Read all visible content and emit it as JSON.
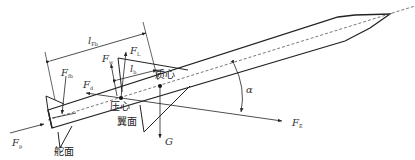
{
  "diagram": {
    "type": "rocket force diagram",
    "labels": {
      "l_fb": {
        "main": "l",
        "sub": "Fb"
      },
      "l_b": {
        "main": "l",
        "sub": "b"
      },
      "F_L": {
        "main": "F",
        "sub": "L"
      },
      "F_w": {
        "main": "F",
        "sub": "w"
      },
      "F_fb": {
        "main": "F",
        "sub": "fb"
      },
      "F_d": {
        "main": "F",
        "sub": "d"
      },
      "F_p": {
        "main": "F",
        "sub": "p"
      },
      "F_E": {
        "main": "F",
        "sub": "E"
      },
      "G": "G",
      "alpha": "α"
    },
    "chinese_labels": {
      "center_of_mass": "质心",
      "center_of_pressure": "压心",
      "wing": "翼面",
      "rudder": "舵面"
    },
    "colors": {
      "line": "#222222",
      "dashed": "#555555",
      "background": "#ffffff"
    }
  }
}
